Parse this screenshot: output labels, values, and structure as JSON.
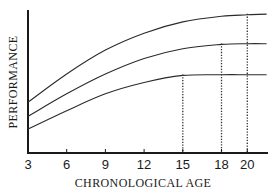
{
  "chart_data": {
    "type": "line",
    "title": "",
    "xlabel": "CHRONOLOGICAL AGE",
    "ylabel": "PERFORMANCE",
    "x_ticks": [
      3,
      6,
      9,
      12,
      15,
      18,
      20
    ],
    "xlim": [
      3,
      21.5
    ],
    "y_ticks": [],
    "grid": false,
    "legend": null,
    "series": [
      {
        "name": "upper curve",
        "x": [
          3,
          6,
          9,
          12,
          15,
          18,
          20,
          21.5
        ],
        "y": [
          0.36,
          0.56,
          0.73,
          0.85,
          0.93,
          0.97,
          0.98,
          0.985
        ],
        "plateau_age": 20
      },
      {
        "name": "middle curve",
        "x": [
          3,
          6,
          9,
          12,
          15,
          18,
          20,
          21.5
        ],
        "y": [
          0.26,
          0.42,
          0.56,
          0.67,
          0.74,
          0.77,
          0.775,
          0.775
        ],
        "plateau_age": 18
      },
      {
        "name": "lower curve",
        "x": [
          3,
          6,
          9,
          12,
          15,
          18,
          20,
          21.5
        ],
        "y": [
          0.17,
          0.3,
          0.42,
          0.5,
          0.55,
          0.555,
          0.555,
          0.555
        ],
        "plateau_age": 15
      }
    ],
    "annotations": [
      {
        "type": "dotted-vertical",
        "x": 15,
        "from_series": "lower curve"
      },
      {
        "type": "dotted-vertical",
        "x": 18,
        "from_series": "middle curve"
      },
      {
        "type": "dotted-vertical",
        "x": 20,
        "from_series": "upper curve"
      }
    ]
  }
}
